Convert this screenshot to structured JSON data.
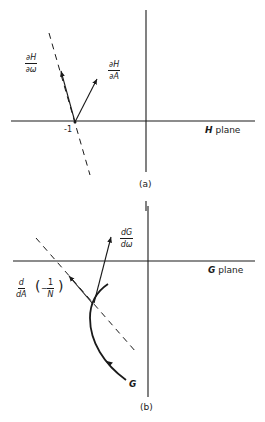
{
  "panel_a": {
    "caption": "(a)",
    "plane_label_var": "H",
    "plane_label_word": "plane",
    "point_label": "-1",
    "vectors": [
      {
        "name": "dH/dω",
        "num": "∂H",
        "den": "∂ω"
      },
      {
        "name": "dH/dA",
        "num": "∂H",
        "den": "∂A"
      }
    ]
  },
  "panel_b": {
    "caption": "(b)",
    "plane_label_var": "G",
    "plane_label_word": "plane",
    "curve_label": "G",
    "vectors": [
      {
        "name": "dG/dω",
        "num": "dG",
        "den": "dω"
      },
      {
        "name": "d/dA(-1/N)",
        "num": "d",
        "den": "dA",
        "inner_num": "1",
        "inner_den": "N",
        "sign": "−"
      }
    ]
  },
  "colors": {
    "ink": "#1a1a1a",
    "background": "#ffffff"
  }
}
